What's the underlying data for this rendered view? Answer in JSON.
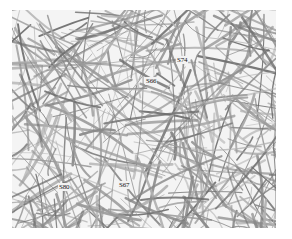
{
  "image": {
    "description": "Grayscale micrograph of a dense random fiber network with sample-site labels",
    "background_color": "#f4f4f4",
    "fiber_colors": [
      "#6e6e6e",
      "#888888",
      "#9a9a9a",
      "#b0b0b0"
    ]
  },
  "labels": [
    {
      "text": "S74",
      "x": 176,
      "y": 56
    },
    {
      "text": "S66",
      "x": 145,
      "y": 77
    },
    {
      "text": "S80",
      "x": 58,
      "y": 183
    },
    {
      "text": "S67",
      "x": 118,
      "y": 181
    }
  ]
}
